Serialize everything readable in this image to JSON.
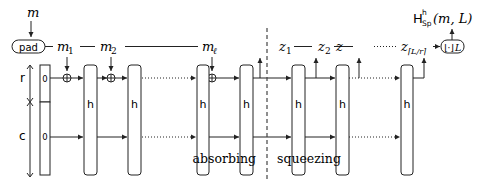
{
  "diagram": {
    "type": "sponge-construction",
    "input": {
      "message_label": "m",
      "pad_label": "pad"
    },
    "message_blocks": [
      {
        "label": "m",
        "sub": "1"
      },
      {
        "label": "m",
        "sub": "2"
      },
      {
        "label": "m",
        "sub": "ℓ"
      }
    ],
    "state": {
      "rate_label": "r",
      "capacity_label": "c",
      "rate_init": "0",
      "capacity_init": "0"
    },
    "permutation_label": "h",
    "phases": {
      "absorbing": "absorbing",
      "squeezing": "squeezing"
    },
    "output_blocks": [
      {
        "label": "z",
        "sub": "1"
      },
      {
        "label": "z",
        "sub": "2"
      },
      {
        "label": "z",
        "sub": "3"
      },
      {
        "label": "z",
        "sub": "⌈L/r⌉"
      }
    ],
    "truncate_box": {
      "left": "⌊·⌋",
      "sub": "L"
    },
    "output_label": {
      "H": "H",
      "sup": "h",
      "sub": "Sp",
      "args": "(m, L)"
    }
  }
}
